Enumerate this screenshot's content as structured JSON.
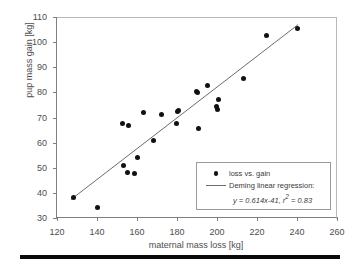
{
  "chart_data": {
    "type": "scatter",
    "title": "",
    "xlabel": "maternal mass loss [kg]",
    "ylabel": "pup mass gain [kg]",
    "xlim": [
      120,
      260
    ],
    "ylim": [
      30,
      110
    ],
    "xticks": [
      120,
      140,
      160,
      180,
      200,
      220,
      240,
      260
    ],
    "yticks": [
      30,
      40,
      50,
      60,
      70,
      80,
      90,
      100,
      110
    ],
    "grid": false,
    "legend_position": "lower-right",
    "series": [
      {
        "name": "loss vs. gain",
        "type": "scatter",
        "marker": "filled-circle",
        "color": "#111111",
        "points": [
          [
            128.0,
            38.0
          ],
          [
            140.0,
            34.0
          ],
          [
            152.5,
            67.5
          ],
          [
            153.0,
            51.0
          ],
          [
            155.0,
            48.3
          ],
          [
            155.5,
            67.0
          ],
          [
            158.5,
            47.8
          ],
          [
            160.0,
            54.0
          ],
          [
            163.0,
            71.8
          ],
          [
            168.0,
            61.0
          ],
          [
            172.0,
            71.3
          ],
          [
            179.5,
            67.6
          ],
          [
            180.0,
            72.5
          ],
          [
            180.5,
            72.8
          ],
          [
            189.5,
            80.5
          ],
          [
            190.0,
            79.8
          ],
          [
            190.5,
            65.5
          ],
          [
            195.0,
            82.8
          ],
          [
            199.5,
            74.5
          ],
          [
            200.0,
            73.0
          ],
          [
            200.5,
            77.0
          ],
          [
            213.0,
            85.5
          ],
          [
            224.5,
            102.5
          ],
          [
            240.0,
            105.3
          ]
        ]
      },
      {
        "name": "Deming linear regression:",
        "type": "line",
        "color": "#6b6b6b",
        "slope": 0.614,
        "intercept": -41,
        "r_squared": 0.83,
        "equation": "y = 0.614x-41, r",
        "equation_sup": "2",
        "equation_tail": " = 0.83",
        "x_range": [
          127,
          241
        ]
      }
    ],
    "legend": {
      "marker_label": "loss vs. gain",
      "line_label": "Deming linear regression:"
    }
  },
  "figure": {
    "background": "#ffffff",
    "axis_color": "#808080",
    "text_color": "#4d4d4d",
    "bottom_rule_color": "#0a0a0a"
  }
}
